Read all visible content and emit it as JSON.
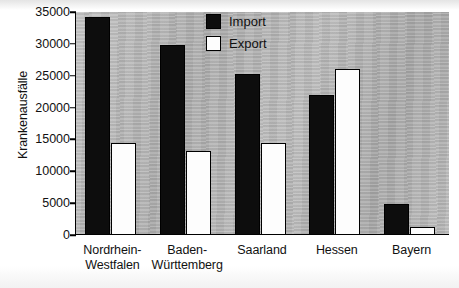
{
  "chart_data": {
    "type": "bar",
    "title": "",
    "xlabel": "",
    "ylabel": "Krankenausfälle",
    "ylim": [
      0,
      35000
    ],
    "ytick_labels": [
      "35000",
      "30000",
      "25000",
      "20000",
      "15000",
      "10000",
      "5000",
      "0"
    ],
    "ytick_values": [
      35000,
      30000,
      25000,
      20000,
      15000,
      10000,
      5000,
      0
    ],
    "grid": false,
    "legend_position": "top-center-right",
    "categories": [
      "Nordrhein-Westfalen",
      "Baden-Württemberg",
      "Saarland",
      "Hessen",
      "Bayern"
    ],
    "category_lines": [
      [
        "Nordrhein-",
        "Westfalen"
      ],
      [
        "Baden-",
        "Württemberg"
      ],
      [
        "Saarland",
        ""
      ],
      [
        "Hessen",
        ""
      ],
      [
        "Bayern",
        ""
      ]
    ],
    "series": [
      {
        "name": "Import",
        "color": "#0d0d0d",
        "values": [
          34200,
          29800,
          25200,
          22000,
          4800
        ]
      },
      {
        "name": "Export",
        "color": "#fdfdfd",
        "values": [
          14400,
          13200,
          14400,
          26000,
          1200
        ]
      }
    ],
    "plot_background_color": "#b4b4b4",
    "axis_color": "#000000"
  },
  "legend": {
    "items": [
      {
        "label": "Import",
        "swatch": "filled-black-square"
      },
      {
        "label": "Export",
        "swatch": "outlined-white-square"
      }
    ]
  }
}
